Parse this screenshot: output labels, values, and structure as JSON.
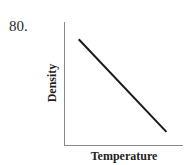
{
  "problem": {
    "number": "80."
  },
  "chart_data": {
    "type": "line",
    "title": "",
    "xlabel": "Temperature",
    "ylabel": "Density",
    "x_ticks": [],
    "y_ticks": [],
    "grid": false,
    "legend": null,
    "series": [
      {
        "name": "Density vs Temperature",
        "trend": "decreasing linear",
        "points": [
          {
            "x": 0.12,
            "y": 0.86
          },
          {
            "x": 0.86,
            "y": 0.11
          }
        ]
      }
    ],
    "xlim": [
      0,
      1
    ],
    "ylim": [
      0,
      1
    ],
    "colors": {
      "line": "#1a1a1a",
      "axis": "#8a8a8a"
    }
  }
}
